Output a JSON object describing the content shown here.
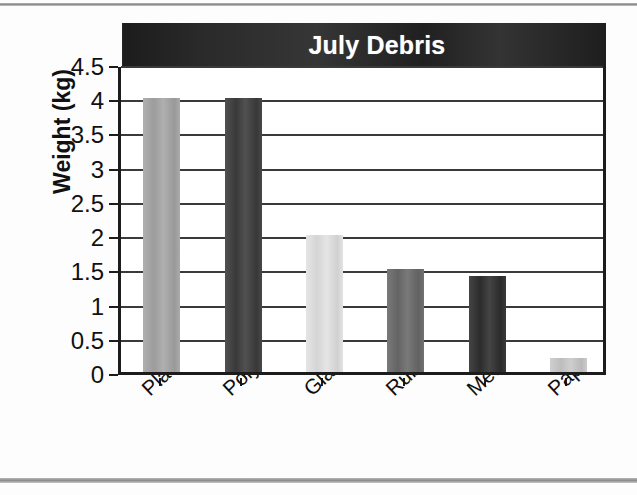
{
  "chart_data": {
    "type": "bar",
    "title": "July Debris",
    "xlabel": "",
    "ylabel": "Weight (kg)",
    "categories": [
      "Plastic",
      "Polystyrene",
      "Glass",
      "Rubber",
      "Metal",
      "Paper"
    ],
    "values": [
      4,
      4,
      2,
      1.5,
      1.4,
      0.2
    ],
    "bar_colors": [
      "#a6a6a6",
      "#3d3d3d",
      "#e2e2e2",
      "#6a6a6a",
      "#2f2f2f",
      "#c9c9c9"
    ],
    "ylim": [
      0,
      4.5
    ],
    "ytick_labels": [
      "4.5",
      "4",
      "3.5",
      "3",
      "2.5",
      "2",
      "1.5",
      "1",
      "0.5",
      "0"
    ],
    "ytick_values": [
      4.5,
      4,
      3.5,
      3,
      2.5,
      2,
      1.5,
      1,
      0.5,
      0
    ],
    "grid": true,
    "legend": "none",
    "title_band_color": "#2b2b2b",
    "title_text_color": "#ffffff",
    "axis_color": "#1c1c1c",
    "plot_background": "#ffffff"
  }
}
